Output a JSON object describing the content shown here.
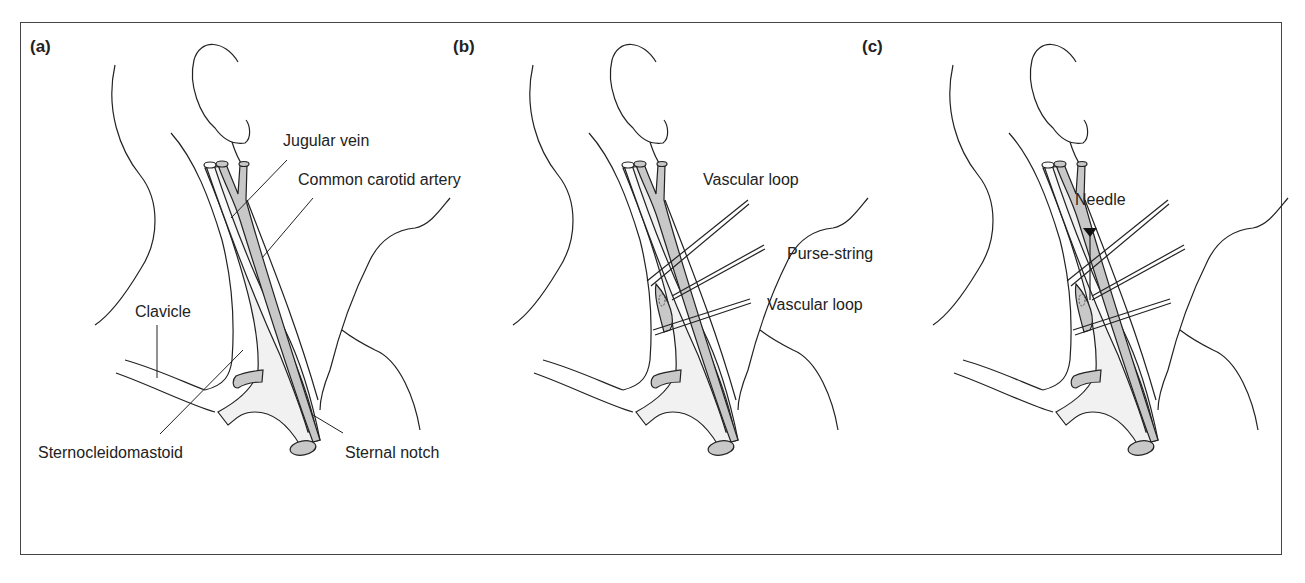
{
  "figure": {
    "panels": [
      {
        "id": "a",
        "label": "(a)",
        "callouts": {
          "jugular_vein": "Jugular vein",
          "common_carotid_artery": "Common carotid artery",
          "clavicle": "Clavicle",
          "sternocleidomastoid": "Sternocleidomastoid",
          "sternal_notch": "Sternal notch"
        }
      },
      {
        "id": "b",
        "label": "(b)",
        "callouts": {
          "vascular_loop_upper": "Vascular loop",
          "purse_string": "Purse-string",
          "vascular_loop_lower": "Vascular loop"
        }
      },
      {
        "id": "c",
        "label": "(c)",
        "callouts": {
          "needle": "Needle"
        }
      }
    ],
    "colors": {
      "line": "#222222",
      "vessel_fill": "#c8c8c8",
      "muscle_fill": "#f1f1f1",
      "background": "#ffffff"
    }
  }
}
